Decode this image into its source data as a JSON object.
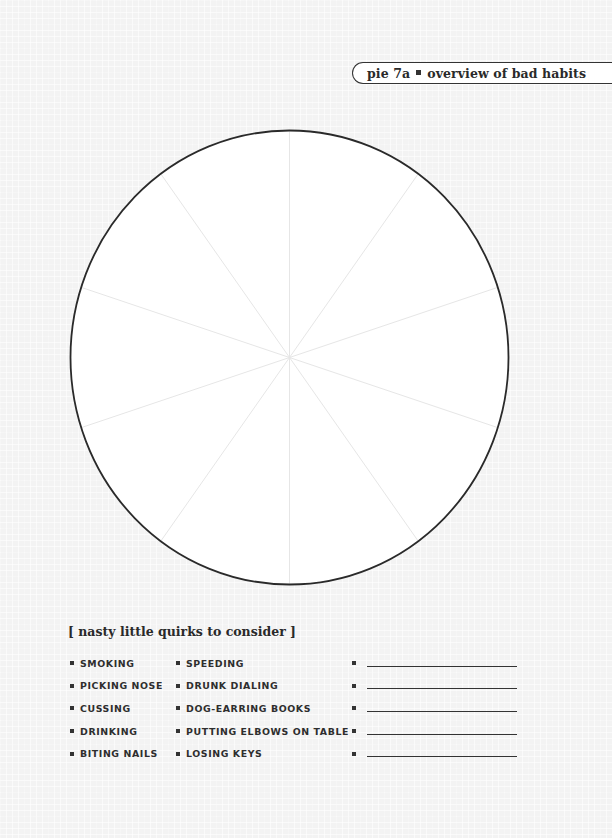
{
  "header": {
    "label_left": "pie 7a",
    "label_right": "overview of bad habits",
    "separator_icon": "square-bullet-icon"
  },
  "chart_data": {
    "type": "pie",
    "slices": 10,
    "categories": [],
    "values": [],
    "note": "Blank pie template divided into 10 equal unlabeled wedges (36° each) for the reader to fill in",
    "outline_color": "#2a2a2a",
    "divider_color": "#e6e6e6"
  },
  "quirks": {
    "title": "[ nasty little quirks to consider ]",
    "column_1": [
      "SMOKING",
      "PICKING NOSE",
      "CUSSING",
      "DRINKING",
      "BITING NAILS"
    ],
    "column_2": [
      "SPEEDING",
      "DRUNK DIALING",
      "DOG-EARRING BOOKS",
      "PUTTING ELBOWS ON TABLE",
      "LOSING KEYS"
    ],
    "column_3_blanks": [
      "",
      "",
      "",
      "",
      ""
    ]
  },
  "colors": {
    "ink": "#2a2a2a",
    "paper": "#f3f3f3",
    "pie_fill": "#ffffff"
  }
}
